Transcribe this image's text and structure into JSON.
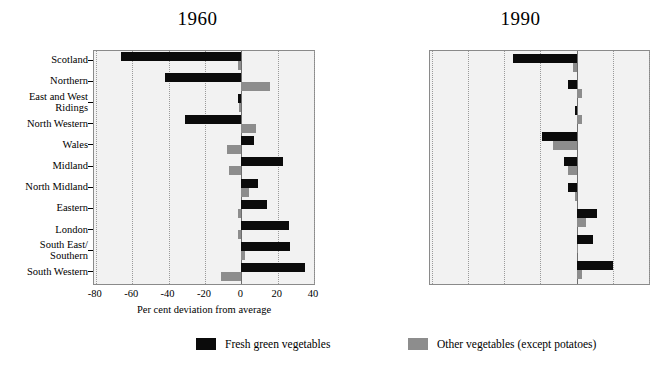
{
  "chart_data": [
    {
      "type": "bar",
      "title": "1960",
      "orientation": "horizontal",
      "xlabel": "Per cent deviation from average",
      "ylabel": "",
      "xlim": [
        -81,
        40
      ],
      "xticks": [
        -80,
        -60,
        -40,
        -20,
        0,
        20,
        40
      ],
      "xticklabels": [
        "-80",
        "-60",
        "-40",
        "-20",
        "0",
        "20",
        "40"
      ],
      "grid": "vertical-dotted",
      "categories": [
        "Scotland",
        "Northern",
        "East and West Ridings",
        "North Western",
        "Wales",
        "Midland",
        "North Midland",
        "Eastern",
        "London",
        "South East/ Southern",
        "South Western"
      ],
      "series": [
        {
          "name": "Fresh green vegetables",
          "color": "#0b0b0b",
          "values": [
            -66,
            -42,
            -2,
            -31,
            7,
            23,
            9,
            14,
            26,
            27,
            35
          ]
        },
        {
          "name": "Other vegetables (except potatoes)",
          "color": "#8d8d8d",
          "values": [
            -2,
            16,
            -1,
            8,
            -8,
            -7,
            4,
            -2,
            -2,
            2,
            -11
          ]
        }
      ]
    },
    {
      "type": "bar",
      "title": "1990",
      "orientation": "horizontal",
      "xlabel": "Per cent deviation from average",
      "ylabel": "",
      "xlim": [
        -81,
        40
      ],
      "xticks": [
        -80,
        -60,
        -40,
        -20,
        0,
        20,
        40
      ],
      "xticklabels": [
        "-80",
        "-60",
        "-40",
        "-20",
        "0",
        "20",
        "40"
      ],
      "grid": "vertical-dotted",
      "categories": [
        "Scotland",
        "Northern",
        "Yorkshire and Humberside",
        "North Western",
        "Wales",
        "West Midlands",
        "East Midlands",
        "South East/ East Anglia",
        "South Western"
      ],
      "series": [
        {
          "name": "Fresh green vegetables",
          "color": "#0b0b0b",
          "values": [
            -35,
            -5,
            -1,
            -19,
            -7,
            -5,
            11,
            9,
            20
          ]
        },
        {
          "name": "Other vegetables (except potatoes)",
          "color": "#8d8d8d",
          "values": [
            -2,
            3,
            3,
            -13,
            -5,
            -1,
            5,
            1,
            3
          ]
        }
      ]
    }
  ],
  "panels": {
    "left": {
      "title": "1960",
      "xtitle": "Per cent deviation from average",
      "xticklabels": [
        "-80",
        "-60",
        "-40",
        "-20",
        "0",
        "20",
        "40"
      ],
      "categories": [
        {
          "lines": [
            "Scotland"
          ]
        },
        {
          "lines": [
            "Northern"
          ]
        },
        {
          "lines": [
            "East and West",
            "Ridings"
          ]
        },
        {
          "lines": [
            "North Western"
          ]
        },
        {
          "lines": [
            "Wales"
          ]
        },
        {
          "lines": [
            "Midland"
          ]
        },
        {
          "lines": [
            "North Midland"
          ]
        },
        {
          "lines": [
            "Eastern"
          ]
        },
        {
          "lines": [
            "London"
          ]
        },
        {
          "lines": [
            "South East/",
            "Southern"
          ]
        },
        {
          "lines": [
            "South Western"
          ]
        }
      ]
    },
    "right": {
      "title": "1990",
      "xtitle": "Per cent deviation from average",
      "xticklabels": [
        "-80",
        "-60",
        "-40",
        "-20",
        "0",
        "20",
        "40"
      ],
      "categories": [
        {
          "lines": [
            "Scotland"
          ]
        },
        {
          "lines": [
            "Northern"
          ]
        },
        {
          "lines": [
            "Yorkshire and",
            "Humberside"
          ]
        },
        {
          "lines": [
            "North Western"
          ]
        },
        {
          "lines": [
            "Wales"
          ]
        },
        {
          "lines": [
            "West Midlands"
          ]
        },
        {
          "lines": [
            "East Midlands"
          ]
        },
        {
          "lines": [
            "South East/",
            "East Anglia"
          ]
        },
        {
          "lines": [
            "South Western"
          ]
        }
      ]
    }
  },
  "legend": {
    "items": [
      {
        "label": "Fresh green vegetables",
        "color": "#0b0b0b"
      },
      {
        "label": "Other vegetables (except potatoes)",
        "color": "#8d8d8d"
      }
    ]
  }
}
